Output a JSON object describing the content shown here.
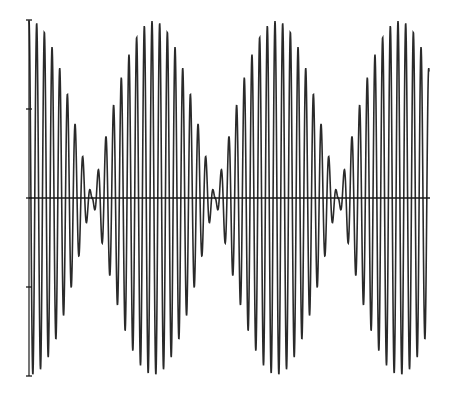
{
  "chart_data": {
    "type": "line",
    "title": "",
    "xlabel": "",
    "ylabel": "",
    "series": [
      {
        "name": "waveform",
        "carrier_cycles_per_beat": 16,
        "beat_count_visible": 3.7,
        "envelope_max_amplitude": 1.0,
        "envelope_nodes_x_fraction": [
          0.155,
          0.465,
          0.778
        ]
      }
    ],
    "ylim": [
      -1,
      1
    ],
    "yticks": [
      -1,
      -0.5,
      0,
      0.5,
      1
    ],
    "ytick_labels": [
      "",
      "",
      "",
      "",
      ""
    ],
    "grid": false,
    "legend": null,
    "line_color": "#2a2a2a",
    "axis_color": "#1a1a1a"
  },
  "layout": {
    "axis_x": 29,
    "y_top": 20,
    "y_zero": 198,
    "y_bottom": 376,
    "x_end": 429,
    "node_px": [
      92,
      215,
      340
    ]
  }
}
